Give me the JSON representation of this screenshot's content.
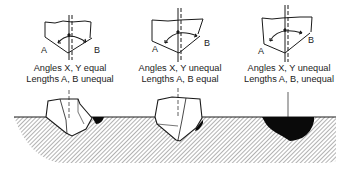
{
  "diagram": {
    "panels": [
      {
        "id": "left",
        "caption_line1": "Angles X, Y equal",
        "caption_line2": "Lengths A, B unequal",
        "label_a": "A",
        "label_b": "B"
      },
      {
        "id": "middle",
        "caption_line1": "Angles X, Y unequal",
        "caption_line2": "Lengths A, B equal",
        "label_a": "A",
        "label_b": "B"
      },
      {
        "id": "right",
        "caption_line1": "Angles X, Y unequal",
        "caption_line2": "Lengths A, B, unequal",
        "label_a": "A",
        "label_b": "B"
      }
    ],
    "colors": {
      "line": "#1a1a1a",
      "hatch": "#555555",
      "fill_black": "#0a0a0a",
      "background": "#ffffff"
    }
  }
}
